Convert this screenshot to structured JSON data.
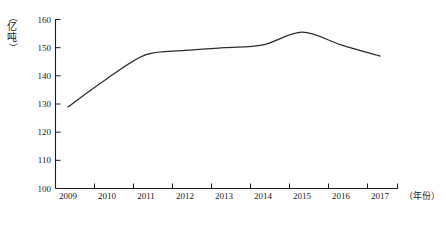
{
  "chart_data": {
    "type": "line",
    "title": "",
    "subtitle": "",
    "xlabel": "（年份）",
    "ylabel": "（亿吨）",
    "categories": [
      "2009",
      "2010",
      "2011",
      "2012",
      "2013",
      "2014",
      "2015",
      "2016",
      "2017"
    ],
    "x": [
      2009,
      2010,
      2011,
      2012,
      2013,
      2014,
      2015,
      2016,
      2017
    ],
    "values": [
      129,
      139,
      147.5,
      149,
      150,
      151,
      155.5,
      151,
      147
    ],
    "series": [
      {
        "name": "",
        "values": [
          129,
          139,
          147.5,
          149,
          150,
          151,
          155.5,
          151,
          147
        ]
      }
    ],
    "peak": {
      "label": "156",
      "value": 156,
      "between": "2014-2015"
    },
    "ylim": [
      100,
      160
    ],
    "ytick_step": 10,
    "ytick_labels": [
      "100",
      "110",
      "120",
      "130",
      "140",
      "150",
      "160"
    ],
    "ytick_values": [
      100,
      110,
      120,
      130,
      140,
      150,
      160
    ],
    "xtick_labels": [
      "2009",
      "2010",
      "2011",
      "2012",
      "2013",
      "2014",
      "2015",
      "2016",
      "2017"
    ],
    "grid": false,
    "legend": "none",
    "legend_position": "none",
    "line_color": "#2b2b2b",
    "axis_color": "#1a1a1a",
    "background_color": "#ffffff",
    "annotations": []
  },
  "axes": {
    "y_unit_chars": [
      "（",
      "亿",
      "吨",
      "）"
    ],
    "y_unit_open_paren": "（",
    "y_unit_char_1": "亿",
    "y_unit_char_2": "吨",
    "y_unit_close_paren": "）",
    "x_caption": "（年份）"
  },
  "figure": {
    "caption": ""
  }
}
